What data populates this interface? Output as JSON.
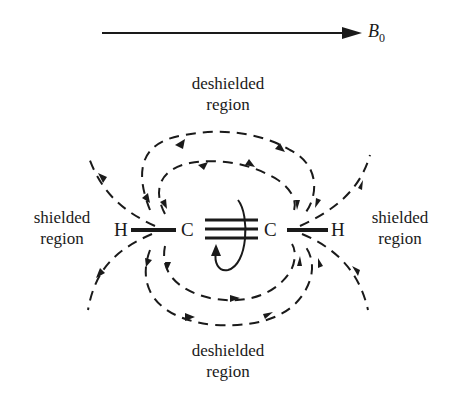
{
  "diagram": {
    "field_label": "B",
    "field_label_subscript": "0",
    "regions": {
      "top": {
        "line1": "deshielded",
        "line2": "region"
      },
      "bottom": {
        "line1": "deshielded",
        "line2": "region"
      },
      "left": {
        "line1": "shielded",
        "line2": "region"
      },
      "right": {
        "line1": "shielded",
        "line2": "region"
      }
    },
    "atoms": {
      "h_left": "H",
      "c_left": "C",
      "c_right": "C",
      "h_right": "H"
    },
    "colors": {
      "ink": "#1a1a1a",
      "background": "#ffffff"
    }
  }
}
